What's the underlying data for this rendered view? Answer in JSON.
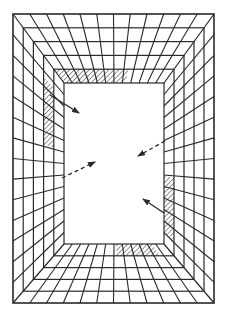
{
  "diagram": {
    "type": "perspective-tunnel-grid",
    "canvas": {
      "width": 228,
      "height": 319
    },
    "outer_rect": {
      "x1": 13,
      "y1": 14,
      "x2": 214,
      "y2": 303
    },
    "inner_rect": {
      "x1": 64,
      "y1": 83,
      "x2": 164,
      "y2": 244
    },
    "ring_count": 5,
    "radial_divisions": {
      "top": 12,
      "bottom": 12,
      "left": 14,
      "right": 14
    },
    "colors": {
      "line": "#2a2a2a",
      "background": "#ffffff",
      "hatch": "#2a2a2a"
    },
    "hatched_regions": [
      {
        "name": "top-wall-hatch",
        "wall": "top",
        "ring": 0,
        "from": 0.0,
        "to": 0.62
      },
      {
        "name": "left-wall-hatch",
        "wall": "left",
        "ring": 1,
        "from": 0.1,
        "to": 0.42
      },
      {
        "name": "right-wall-hatch",
        "wall": "right",
        "ring": 0,
        "from": 0.58,
        "to": 0.92
      },
      {
        "name": "bottom-wall-hatch",
        "wall": "bottom",
        "ring": 0,
        "from": 0.52,
        "to": 0.88
      }
    ],
    "arrows": [
      {
        "name": "arrow-top-left",
        "style": "solid",
        "x1": 50,
        "y1": 95,
        "x2": 79,
        "y2": 113
      },
      {
        "name": "arrow-bottom-right",
        "style": "solid",
        "x1": 164,
        "y1": 213,
        "x2": 143,
        "y2": 199
      },
      {
        "name": "arrow-left-dashed",
        "style": "dashed",
        "x1": 62,
        "y1": 178,
        "x2": 95,
        "y2": 162
      },
      {
        "name": "arrow-right-dashed",
        "style": "dashed",
        "x1": 165,
        "y1": 141,
        "x2": 138,
        "y2": 156
      }
    ]
  }
}
